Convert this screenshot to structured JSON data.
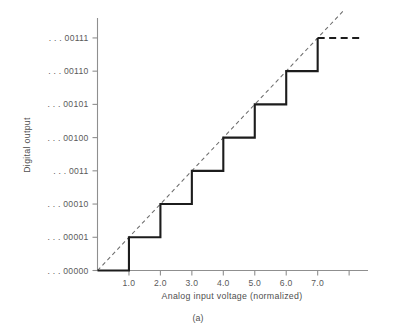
{
  "figure": {
    "caption": "(a)",
    "background_color": "#ffffff"
  },
  "chart_data": {
    "type": "line",
    "title": "",
    "subtitle": "",
    "xlabel": "Analog input voltage (normalized)",
    "ylabel": "Digital output",
    "grid": false,
    "legend_position": "none",
    "xlim": [
      0,
      8.6
    ],
    "ylim": [
      0,
      7.6
    ],
    "x_tick_values": [
      1.0,
      2.0,
      3.0,
      4.0,
      5.0,
      6.0,
      7.0,
      8.0
    ],
    "x_tick_labels": [
      "1.0",
      "2.0",
      "3.0",
      "4.0",
      "5.0",
      "6.0",
      "7.0",
      ""
    ],
    "y_tick_values": [
      0,
      1,
      2,
      3,
      4,
      5,
      6,
      7
    ],
    "y_tick_labels": [
      ". . . 00000",
      ". . . 00001",
      ". . . 00010",
      ". . . 0011",
      ". . . 00100",
      ". . . 00101",
      ". . . 00110",
      ". . . 00111"
    ],
    "series": [
      {
        "name": "Quantized digital output (staircase)",
        "style": "solid",
        "color": "#1c1c1c",
        "step_type": "post",
        "x": [
          0,
          1,
          1,
          2,
          2,
          3,
          3,
          4,
          4,
          5,
          5,
          6,
          6,
          7,
          7
        ],
        "y": [
          0,
          0,
          1,
          1,
          2,
          2,
          3,
          3,
          4,
          4,
          5,
          5,
          6,
          6,
          7
        ],
        "tail": {
          "style": "dashed",
          "x": [
            7,
            8.35
          ],
          "y": [
            7,
            7
          ]
        }
      },
      {
        "name": "Ideal analog transfer line",
        "style": "dashed",
        "color": "#6d6d6d",
        "x": [
          0,
          7.85
        ],
        "y": [
          0,
          7.85
        ]
      }
    ],
    "annotations": [
      {
        "text": "Quantization staircase rises one LSB at each integer input level",
        "visible": false
      }
    ]
  },
  "colors": {
    "staircase": "#1c1c1c",
    "ideal_line": "#6d6d6d",
    "axis": "#8f8f8f",
    "text": "#4f4f4f"
  }
}
